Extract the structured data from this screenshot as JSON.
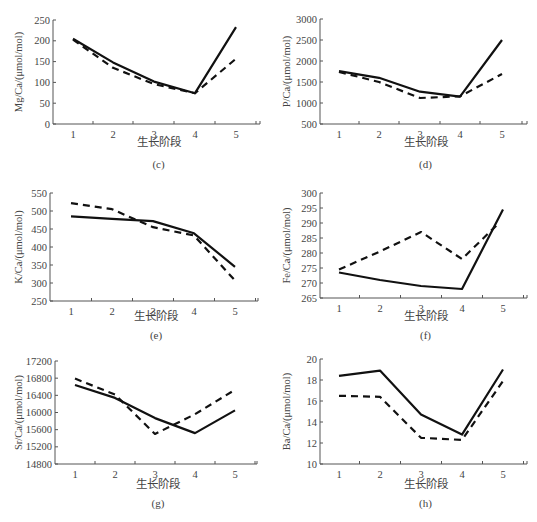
{
  "figure": {
    "xlabel": "生长阶段",
    "series_styles": [
      {
        "name": "solid-series",
        "dash": "",
        "color": "#111111",
        "width": 2.2
      },
      {
        "name": "dashed-series",
        "dash": "7,5",
        "color": "#111111",
        "width": 2.2
      }
    ]
  },
  "chart_data": [
    {
      "panel": "(c)",
      "type": "line",
      "ylabel": "Mg/Ca/(μmol/mol)",
      "xlabel": "生长阶段",
      "categories": [
        1,
        2,
        3,
        4,
        5
      ],
      "ylim": [
        0,
        250
      ],
      "yticks": [
        0,
        50,
        100,
        150,
        200,
        250
      ],
      "series": [
        {
          "name": "solid",
          "values": [
            205,
            148,
            102,
            74,
            233
          ]
        },
        {
          "name": "dashed",
          "values": [
            203,
            135,
            96,
            74,
            157
          ]
        }
      ]
    },
    {
      "panel": "(d)",
      "type": "line",
      "ylabel": "P/Ca/(μmol/mol)",
      "xlabel": "生长阶段",
      "categories": [
        1,
        2,
        3,
        4,
        5
      ],
      "ylim": [
        500,
        3000
      ],
      "yticks": [
        500,
        1000,
        1500,
        2000,
        2500,
        3000
      ],
      "series": [
        {
          "name": "solid",
          "values": [
            1760,
            1600,
            1270,
            1150,
            2500
          ]
        },
        {
          "name": "dashed",
          "values": [
            1740,
            1500,
            1120,
            1160,
            1690
          ]
        }
      ]
    },
    {
      "panel": "(e)",
      "type": "line",
      "ylabel": "K/Ca/(μmol/mol)",
      "xlabel": "生长阶段",
      "categories": [
        1,
        2,
        3,
        4,
        5
      ],
      "ylim": [
        250,
        550
      ],
      "yticks": [
        250,
        300,
        350,
        400,
        450,
        500,
        550
      ],
      "series": [
        {
          "name": "solid",
          "values": [
            485,
            478,
            472,
            438,
            345
          ]
        },
        {
          "name": "dashed",
          "values": [
            522,
            505,
            455,
            432,
            307
          ]
        }
      ]
    },
    {
      "panel": "(f)",
      "type": "line",
      "ylabel": "Fe/Ca/(μmol/mol)",
      "xlabel": "生长阶段",
      "categories": [
        1,
        2,
        3,
        4,
        5
      ],
      "ylim": [
        265,
        300
      ],
      "yticks": [
        265,
        270,
        275,
        280,
        285,
        290,
        295,
        300
      ],
      "series": [
        {
          "name": "solid",
          "values": [
            273.5,
            271,
            269,
            268,
            294.5
          ]
        },
        {
          "name": "dashed",
          "values": [
            274.5,
            280.5,
            287,
            278,
            290
          ]
        }
      ]
    },
    {
      "panel": "(g)",
      "type": "line",
      "ylabel": "Sr/Ca/(μmol/mol)",
      "xlabel": "生长阶段",
      "categories": [
        1,
        2,
        3,
        4,
        5
      ],
      "ylim": [
        14800,
        17200
      ],
      "yticks": [
        14800,
        15200,
        15600,
        16000,
        16400,
        16800,
        17200
      ],
      "series": [
        {
          "name": "solid",
          "values": [
            16640,
            16340,
            15870,
            15520,
            16050
          ]
        },
        {
          "name": "dashed",
          "values": [
            16790,
            16420,
            15500,
            15960,
            16530
          ]
        }
      ]
    },
    {
      "panel": "(h)",
      "type": "line",
      "ylabel": "Ba/Ca/(μmol/mol)",
      "xlabel": "生长阶段",
      "categories": [
        1,
        2,
        3,
        4,
        5
      ],
      "ylim": [
        10,
        20
      ],
      "yticks": [
        10,
        12,
        14,
        16,
        18,
        20
      ],
      "series": [
        {
          "name": "solid",
          "values": [
            18.4,
            18.9,
            14.7,
            12.8,
            19.0
          ]
        },
        {
          "name": "dashed",
          "values": [
            16.5,
            16.4,
            12.5,
            12.3,
            17.9
          ]
        }
      ]
    }
  ],
  "layout": {
    "panels": [
      {
        "x0": 53,
        "x1": 260,
        "ytop": 20,
        "ybot": 124,
        "cat_x": [
          73,
          113,
          154,
          195,
          236
        ],
        "xlabel_y": 146,
        "plabel_y": 168,
        "ylabel_x": 22
      },
      {
        "x0": 320,
        "x1": 527,
        "ytop": 19,
        "ybot": 124,
        "cat_x": [
          339,
          379,
          420,
          460,
          502
        ],
        "xlabel_y": 146,
        "plabel_y": 168,
        "ylabel_x": 290
      },
      {
        "x0": 50,
        "x1": 258,
        "ytop": 193,
        "ybot": 301,
        "cat_x": [
          71,
          112,
          153,
          194,
          235
        ],
        "xlabel_y": 320,
        "plabel_y": 339,
        "ylabel_x": 22
      },
      {
        "x0": 320,
        "x1": 527,
        "ytop": 193,
        "ybot": 298,
        "cat_x": [
          339,
          380,
          421,
          462,
          503
        ],
        "xlabel_y": 320,
        "plabel_y": 339,
        "ylabel_x": 290
      },
      {
        "x0": 55,
        "x1": 257,
        "ytop": 361,
        "ybot": 464,
        "cat_x": [
          75,
          115,
          155,
          195,
          235
        ],
        "xlabel_y": 488,
        "plabel_y": 507,
        "ylabel_x": 22
      },
      {
        "x0": 320,
        "x1": 527,
        "ytop": 359,
        "ybot": 464,
        "cat_x": [
          339,
          380,
          421,
          462,
          503
        ],
        "xlabel_y": 488,
        "plabel_y": 507,
        "ylabel_x": 290
      }
    ]
  }
}
